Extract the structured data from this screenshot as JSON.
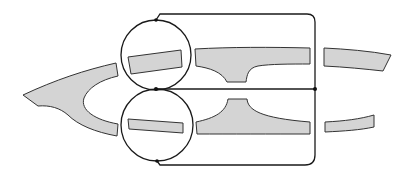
{
  "diagram": {
    "colors": {
      "background": "#ffffff",
      "strip_fill": "#d4d4d4",
      "strip_outline": "#333333",
      "wire": "#1a1a1a",
      "node": "#111111"
    },
    "elements": {
      "left_branch": "Y-shaped strip on left splitting into upper and lower arms",
      "upper_circle": "Upper circular loop enclosing a short strip segment",
      "lower_circle": "Lower circular loop enclosing a short strip segment",
      "center_node": "Junction dot where the two circles touch",
      "upper_t_section": "Upper T-shaped strip with stub pointing down",
      "lower_t_section": "Lower T-shaped strip with stub pointing up",
      "right_upper_strip": "Upper right strip segment",
      "right_lower_strip": "Lower right strip segment",
      "right_bus": "Vertical wire bus on the right",
      "bus_node": "Junction dot on the right bus"
    },
    "text_labels": []
  }
}
